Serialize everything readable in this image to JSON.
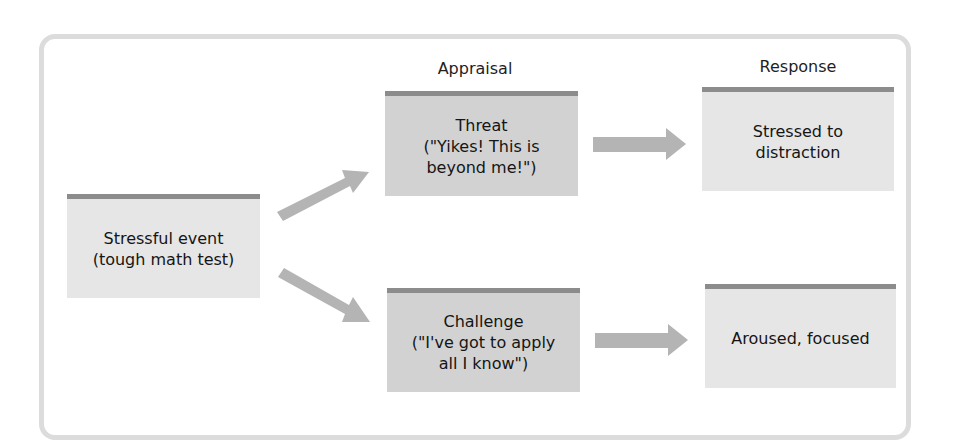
{
  "diagram": {
    "columns": {
      "appraisal_heading": "Appraisal",
      "response_heading": "Response"
    },
    "nodes": {
      "event": {
        "text": "Stressful event\n(tough math test)"
      },
      "threat": {
        "text": "Threat\n(\"Yikes! This is\nbeyond me!\")"
      },
      "challenge": {
        "text": "Challenge\n(\"I've got to apply\nall I know\")"
      },
      "threat_response": {
        "text": "Stressed to\ndistraction"
      },
      "challenge_response": {
        "text": "Aroused, focused"
      }
    },
    "edges": [
      {
        "from": "event",
        "to": "threat"
      },
      {
        "from": "event",
        "to": "challenge"
      },
      {
        "from": "threat",
        "to": "threat_response"
      },
      {
        "from": "challenge",
        "to": "challenge_response"
      }
    ],
    "colors": {
      "frame": "#dcdcdc",
      "box_top_bar": "#8c8c8c",
      "box_light": "#e6e6e6",
      "box_mid": "#d2d2d2",
      "arrow": "#b4b4b4"
    }
  }
}
